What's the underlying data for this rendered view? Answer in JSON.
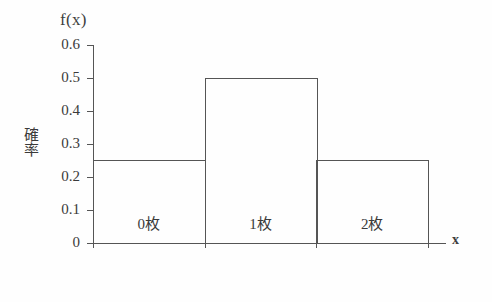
{
  "chart_data": {
    "type": "bar",
    "title": "",
    "subtitle": "",
    "xlabel": "x",
    "ylabel": "確率",
    "value_axis_label": "f(x)",
    "categories": [
      "0枚",
      "1枚",
      "2枚"
    ],
    "values": [
      0.25,
      0.5,
      0.25
    ],
    "ylim": [
      0,
      0.6
    ],
    "ytick_values": [
      0,
      0.1,
      0.2,
      0.3,
      0.4,
      0.5,
      0.6
    ],
    "ytick_labels": [
      "0",
      "0.1",
      "0.2",
      "0.3",
      "0.4",
      "0.5",
      "0.6"
    ],
    "grid": false,
    "legend": null,
    "legend_position": "none",
    "bar_style": "outline",
    "colors": {
      "line": "#555555",
      "text": "#3a3a3a",
      "background": "#fefefe",
      "bar_fill": "none"
    },
    "annotations": []
  }
}
